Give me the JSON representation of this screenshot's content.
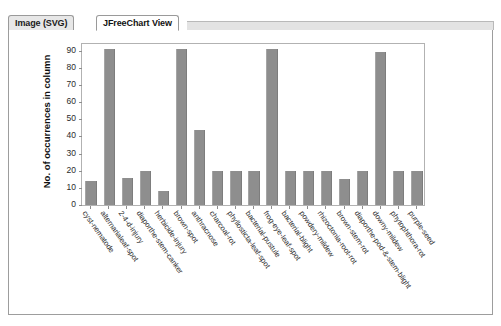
{
  "window": {
    "tabs": [
      {
        "label": "Image (SVG)",
        "active": false
      },
      {
        "label": "JFreeChart View",
        "active": true
      }
    ]
  },
  "colors": {
    "bar_fill": "#8e8e8e",
    "plot_border": "#b2b2b2",
    "axis": "#8d8d8d",
    "panel_border": "#9d9d9d",
    "tab_inactive": "#e7e7e7",
    "tab_active": "#ffffff",
    "text": "#111111"
  },
  "chart_data": {
    "type": "bar",
    "title": "",
    "subtitle": "",
    "xlabel": "",
    "ylabel": "No. of occurrences in column",
    "ylim": [
      0,
      95
    ],
    "yticks": [
      0,
      10,
      20,
      30,
      40,
      50,
      60,
      70,
      80,
      90
    ],
    "grid": false,
    "legend": false,
    "legend_position": "none",
    "categories": [
      "cyst-nematode",
      "alternarialeaf-spot",
      "2-4-d-injury",
      "diaporthe-stem-canker",
      "herbicide-injury",
      "brown-spot",
      "anthracnose",
      "charcoal-rot",
      "phyllosticta-leaf-spot",
      "bacterial-pustule",
      "frog-eye-leaf-spot",
      "bacterial-blight",
      "powdery-mildew",
      "rhizoctonia-root-rot",
      "brown-stem-rot",
      "diaporthe-pod-&-stem-blight",
      "downy-mildew",
      "phytophthora-rot",
      "purple-seed"
    ],
    "values": [
      14,
      91,
      16,
      20,
      8,
      91,
      44,
      20,
      20,
      20,
      91,
      20,
      20,
      20,
      15,
      20,
      89,
      20,
      20
    ]
  }
}
